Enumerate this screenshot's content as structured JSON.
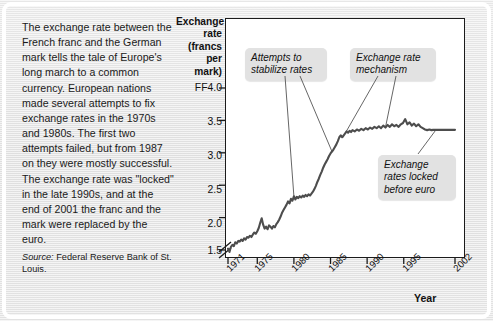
{
  "article": {
    "body": "The exchange rate between the French franc and the German mark tells the tale of Europe's long march to a common currency. European nations made several attempts to fix exchange rates in the 1970s and 1980s. The first two attempts failed, but from 1987 on they were mostly successful. The exchange rate was \"locked\" in the late 1990s, and at the end of 2001 the franc and the mark were replaced by the euro.",
    "source_lead": "Source:",
    "source_text": " Federal Reserve Bank of St. Louis."
  },
  "chart_data": {
    "type": "line",
    "title": "",
    "ylabel": "Exchange rate (francs per mark)",
    "ylabel_lines": [
      "Exchange",
      "rate",
      "(francs",
      "per mark)"
    ],
    "xlabel": "Year",
    "ylim": [
      1.35,
      4.0
    ],
    "yticks": [
      1.5,
      2.0,
      2.5,
      3.0,
      3.5,
      4.0
    ],
    "ytick_labels": [
      "1.5",
      "2.0",
      "2.5",
      "3.0",
      "3.5",
      "FF4.0"
    ],
    "axis_break": true,
    "xlim": [
      1971,
      2002
    ],
    "xticks": [
      1971,
      1975,
      1980,
      1985,
      1990,
      1995,
      2002
    ],
    "xtick_labels": [
      "1971",
      "1975",
      "1980",
      "1985",
      "1990",
      "1995",
      "2002"
    ],
    "grid": false,
    "legend": "none",
    "line_color": "#4d4d4d",
    "series": [
      {
        "name": "French franc per German mark",
        "x": [
          1971.0,
          1971.2,
          1971.4,
          1971.6,
          1971.8,
          1972.0,
          1972.2,
          1972.4,
          1972.6,
          1972.8,
          1973.0,
          1973.2,
          1973.4,
          1973.6,
          1973.8,
          1974.0,
          1974.2,
          1974.4,
          1974.6,
          1974.8,
          1975.0,
          1975.2,
          1975.4,
          1975.6,
          1975.8,
          1976.0,
          1976.2,
          1976.4,
          1976.6,
          1976.8,
          1977.0,
          1977.2,
          1977.4,
          1977.6,
          1977.8,
          1978.0,
          1978.2,
          1978.4,
          1978.6,
          1978.8,
          1979.0,
          1979.2,
          1979.4,
          1979.6,
          1979.8,
          1980.0,
          1980.2,
          1980.4,
          1980.6,
          1980.8,
          1981.0,
          1981.2,
          1981.4,
          1981.6,
          1981.8,
          1982.0,
          1982.2,
          1982.4,
          1982.6,
          1982.8,
          1983.0,
          1983.2,
          1983.4,
          1983.6,
          1983.8,
          1984.0,
          1984.2,
          1984.4,
          1984.6,
          1984.8,
          1985.0,
          1985.2,
          1985.4,
          1985.6,
          1985.8,
          1986.0,
          1986.2,
          1986.4,
          1986.6,
          1986.8,
          1987.0,
          1987.2,
          1987.4,
          1987.6,
          1987.8,
          1988.0,
          1988.3,
          1988.6,
          1988.9,
          1989.2,
          1989.5,
          1989.8,
          1990.1,
          1990.4,
          1990.7,
          1991.0,
          1991.3,
          1991.6,
          1991.9,
          1992.2,
          1992.5,
          1992.8,
          1993.1,
          1993.4,
          1993.7,
          1994.0,
          1994.3,
          1994.6,
          1994.9,
          1995.2,
          1995.5,
          1995.8,
          1996.1,
          1996.4,
          1996.7,
          1997.0,
          1997.3,
          1997.6,
          1997.9,
          1998.2,
          1998.5,
          1998.8,
          1999.0,
          1999.5,
          2000.0,
          2000.5,
          2001.0,
          2001.5,
          2002.0
        ],
        "y": [
          1.52,
          1.47,
          1.55,
          1.58,
          1.56,
          1.62,
          1.6,
          1.64,
          1.63,
          1.66,
          1.64,
          1.68,
          1.66,
          1.7,
          1.69,
          1.72,
          1.7,
          1.74,
          1.77,
          1.75,
          1.79,
          1.84,
          1.92,
          1.99,
          1.89,
          1.83,
          1.86,
          1.82,
          1.88,
          1.86,
          1.83,
          1.87,
          1.85,
          1.9,
          1.93,
          1.97,
          2.02,
          2.08,
          2.12,
          2.16,
          2.2,
          2.25,
          2.22,
          2.29,
          2.26,
          2.33,
          2.28,
          2.32,
          2.3,
          2.33,
          2.31,
          2.34,
          2.32,
          2.35,
          2.33,
          2.36,
          2.34,
          2.37,
          2.4,
          2.44,
          2.49,
          2.55,
          2.6,
          2.66,
          2.71,
          2.77,
          2.82,
          2.86,
          2.9,
          2.95,
          2.99,
          3.02,
          3.05,
          3.09,
          3.13,
          3.18,
          3.24,
          3.27,
          3.24,
          3.27,
          3.3,
          3.33,
          3.31,
          3.34,
          3.32,
          3.35,
          3.33,
          3.36,
          3.34,
          3.37,
          3.35,
          3.38,
          3.36,
          3.39,
          3.37,
          3.4,
          3.38,
          3.41,
          3.38,
          3.42,
          3.39,
          3.43,
          3.4,
          3.44,
          3.41,
          3.43,
          3.4,
          3.44,
          3.46,
          3.52,
          3.44,
          3.47,
          3.42,
          3.45,
          3.41,
          3.44,
          3.4,
          3.38,
          3.36,
          3.35,
          3.36,
          3.35,
          3.3539,
          3.3539,
          3.3539,
          3.3539,
          3.3539,
          3.3539,
          3.3539
        ]
      }
    ],
    "annotations": [
      {
        "id": "attempts",
        "text_lines": [
          "Attempts to",
          "stabilize rates"
        ],
        "points_to": [
          1980.0,
          1979.8
        ]
      },
      {
        "id": "erm",
        "text_lines": [
          "Exchange rate",
          "mechanism"
        ],
        "points_to": [
          1987.0,
          1992.5
        ]
      },
      {
        "id": "locked",
        "text_lines": [
          "Exchange",
          "rates locked",
          "before euro"
        ],
        "points_to": [
          1999.0
        ]
      }
    ]
  }
}
